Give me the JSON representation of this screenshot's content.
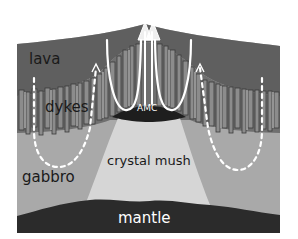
{
  "diagram": {
    "type": "oceanic crust cross-section",
    "labels": {
      "lava": "lava",
      "dykes": "dykes",
      "gabbro": "gabbro",
      "crystal_mush": "crystal mush",
      "mantle": "mantle",
      "amc": "AMC"
    },
    "colors": {
      "background": "#ffffff",
      "lava": "#5f5f5f",
      "dykes_fill": "#8a8a8a",
      "dykes_stroke": "#3c3c3c",
      "gabbro": "#a9a9a9",
      "crystal_mush": "#d6d6d6",
      "mantle": "#2b2b2b",
      "amc": "#1e1e1e",
      "flow_lines": "#ffffff",
      "label_dark": "#1a1a1a",
      "label_light": "#ffffff"
    },
    "flow_arrows": [
      {
        "name": "left-convection-loop",
        "style": "dashed"
      },
      {
        "name": "right-convection-loop",
        "style": "dashed"
      },
      {
        "name": "left-hydrothermal-plume",
        "style": "solid"
      },
      {
        "name": "right-hydrothermal-plume",
        "style": "solid"
      },
      {
        "name": "central-upflow-arrows",
        "style": "solid"
      }
    ]
  }
}
